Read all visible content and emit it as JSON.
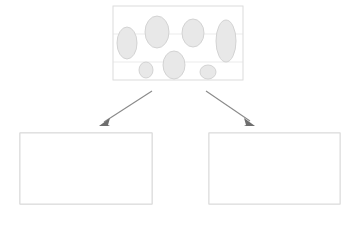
{
  "figure": {
    "background_color": "#ffffff",
    "width": 354,
    "height": 225
  },
  "colors": {
    "panel_border": "#d8d8d8",
    "gridline": "#e2e2e2",
    "matrix_gray": "#b5b5b5",
    "particle_light": "#e8e8e8",
    "particle_outline": "#cfcfcf",
    "particle_outline_dark": "#a9a9a9",
    "column_outer": "#b9b9b9",
    "column_inner": "#ececec",
    "arrow": "#8a8a8a",
    "arrow_head": "#6e6e6e"
  },
  "panels": [
    {
      "id": "top-panel",
      "name": "dispersed-particles-panel",
      "label": "",
      "x": 113,
      "y": 6,
      "width": 130,
      "height": 74,
      "background": "#ffffff",
      "gridlines_y": [
        34,
        62
      ],
      "particle_count": 8,
      "particles": [
        {
          "cx": 127,
          "cy": 43,
          "rx": 10,
          "ry": 16,
          "rot": 0
        },
        {
          "cx": 157,
          "cy": 32,
          "rx": 12,
          "ry": 16,
          "rot": 0
        },
        {
          "cx": 193,
          "cy": 33,
          "rx": 11,
          "ry": 14,
          "rot": 0
        },
        {
          "cx": 226,
          "cy": 41,
          "rx": 10,
          "ry": 21,
          "rot": 0
        },
        {
          "cx": 146,
          "cy": 70,
          "rx": 7,
          "ry": 8,
          "rot": 0
        },
        {
          "cx": 174,
          "cy": 65,
          "rx": 11,
          "ry": 14,
          "rot": 0
        },
        {
          "cx": 208,
          "cy": 72,
          "rx": 8,
          "ry": 7,
          "rot": 0
        }
      ]
    },
    {
      "id": "bottom-left-panel",
      "name": "percolated-matrix-panel",
      "label": "",
      "x": 20,
      "y": 133,
      "width": 132,
      "height": 71,
      "background": "#b5b5b5",
      "gridlines_y": [
        160,
        186
      ],
      "particle_count": 9
    },
    {
      "id": "bottom-right-panel",
      "name": "aligned-columns-panel",
      "label": "",
      "x": 209,
      "y": 133,
      "width": 131,
      "height": 71,
      "background": "#ffffff",
      "gridlines_y": [
        160,
        186
      ],
      "column_count": 4,
      "columns": [
        {
          "cx": 227,
          "w": 20,
          "top": 137,
          "bottom": 201
        },
        {
          "cx": 262,
          "w": 34,
          "top": 135,
          "bottom": 203
        },
        {
          "cx": 299,
          "w": 20,
          "top": 137,
          "bottom": 201
        },
        {
          "cx": 331,
          "w": 20,
          "top": 137,
          "bottom": 201
        }
      ]
    }
  ],
  "arrows": [
    {
      "id": "arrow-left",
      "name": "arrow-to-percolated",
      "x1": 150,
      "y1": 92,
      "x2": 102,
      "y2": 124,
      "direction": "down-left"
    },
    {
      "id": "arrow-right",
      "name": "arrow-to-columns",
      "x1": 208,
      "y1": 92,
      "x2": 252,
      "y2": 124,
      "direction": "down-right"
    }
  ]
}
